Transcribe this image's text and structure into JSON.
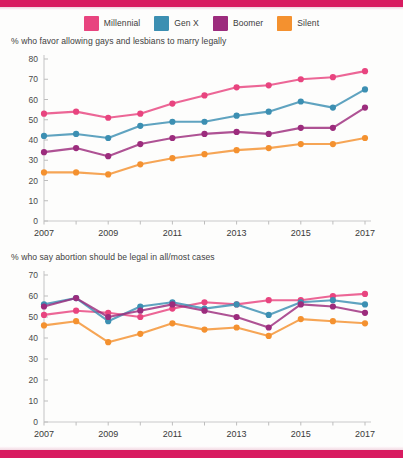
{
  "document": {
    "accent_color": "#d81b60",
    "background": "#ffffff"
  },
  "legend": {
    "position": "top-center",
    "items": [
      {
        "label": "Millennial",
        "color": "#e8447f",
        "icon": "color-swatch"
      },
      {
        "label": "Gen X",
        "color": "#3c8fb2",
        "icon": "color-swatch"
      },
      {
        "label": "Boomer",
        "color": "#9c2c7d",
        "icon": "color-swatch"
      },
      {
        "label": "Silent",
        "color": "#f4912f",
        "icon": "color-swatch"
      }
    ]
  },
  "chart_data": [
    {
      "id": "marriage",
      "type": "line",
      "title": "% who favor allowing gays and lesbians to marry legally",
      "xlabel": "",
      "ylabel": "",
      "ylim": [
        0,
        80
      ],
      "ytick_step": 10,
      "yticks": [
        0,
        10,
        20,
        30,
        40,
        50,
        60,
        70,
        80
      ],
      "xlim": [
        2007,
        2017
      ],
      "x": [
        2007,
        2008,
        2009,
        2010,
        2011,
        2012,
        2013,
        2014,
        2015,
        2016,
        2017
      ],
      "xticks": [
        2007,
        2008,
        2009,
        2010,
        2011,
        2012,
        2013,
        2014,
        2015,
        2016,
        2017
      ],
      "xtick_labels": [
        "2007",
        "",
        "2009",
        "",
        "2011",
        "",
        "2013",
        "",
        "2015",
        "",
        "2017"
      ],
      "grid": false,
      "legend_position": "top",
      "series": [
        {
          "name": "Millennial",
          "color": "#e8447f",
          "values": [
            53,
            54,
            51,
            53,
            58,
            62,
            66,
            67,
            70,
            71,
            74
          ]
        },
        {
          "name": "Gen X",
          "color": "#3c8fb2",
          "values": [
            42,
            43,
            41,
            47,
            49,
            49,
            52,
            54,
            59,
            56,
            65
          ]
        },
        {
          "name": "Boomer",
          "color": "#9c2c7d",
          "values": [
            34,
            36,
            32,
            38,
            41,
            43,
            44,
            43,
            46,
            46,
            56
          ]
        },
        {
          "name": "Silent",
          "color": "#f4912f",
          "values": [
            24,
            24,
            23,
            28,
            31,
            33,
            35,
            36,
            38,
            38,
            41
          ]
        }
      ]
    },
    {
      "id": "abortion",
      "type": "line",
      "title": "% who say abortion should be legal in all/most cases",
      "xlabel": "",
      "ylabel": "",
      "ylim": [
        0,
        70
      ],
      "ytick_step": 10,
      "yticks": [
        0,
        10,
        20,
        30,
        40,
        50,
        60,
        70
      ],
      "xlim": [
        2007,
        2017
      ],
      "x": [
        2007,
        2008,
        2009,
        2010,
        2011,
        2012,
        2013,
        2014,
        2015,
        2016,
        2017
      ],
      "xticks": [
        2007,
        2008,
        2009,
        2010,
        2011,
        2012,
        2013,
        2014,
        2015,
        2016,
        2017
      ],
      "xtick_labels": [
        "2007",
        "",
        "2009",
        "",
        "2011",
        "",
        "2013",
        "",
        "2015",
        "",
        "2017"
      ],
      "grid": false,
      "legend_position": "top",
      "series": [
        {
          "name": "Millennial",
          "color": "#e8447f",
          "values": [
            51,
            53,
            52,
            50,
            54,
            57,
            56,
            58,
            58,
            60,
            61
          ]
        },
        {
          "name": "Gen X",
          "color": "#3c8fb2",
          "values": [
            56,
            59,
            48,
            55,
            57,
            54,
            56,
            51,
            57,
            58,
            56
          ]
        },
        {
          "name": "Boomer",
          "color": "#9c2c7d",
          "values": [
            55,
            59,
            50,
            53,
            56,
            53,
            50,
            45,
            56,
            55,
            52
          ]
        },
        {
          "name": "Silent",
          "color": "#f4912f",
          "values": [
            46,
            48,
            38,
            42,
            47,
            44,
            45,
            41,
            49,
            48,
            47
          ]
        }
      ]
    }
  ]
}
